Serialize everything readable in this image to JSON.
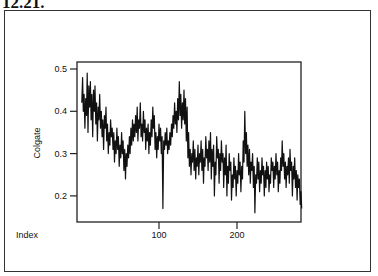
{
  "heading": "12.21.",
  "chart_data": {
    "type": "line",
    "title": "",
    "xlabel": "Index",
    "ylabel": "Colgate",
    "xlim": [
      0,
      280
    ],
    "ylim": [
      0.14,
      0.52
    ],
    "xticks": [
      100,
      200
    ],
    "yticks": [
      0.2,
      0.3,
      0.4,
      0.5
    ],
    "grid": false,
    "legend": null,
    "x_start": 1,
    "values": [
      0.42,
      0.48,
      0.4,
      0.44,
      0.36,
      0.43,
      0.39,
      0.49,
      0.35,
      0.46,
      0.41,
      0.47,
      0.38,
      0.44,
      0.34,
      0.45,
      0.4,
      0.46,
      0.37,
      0.42,
      0.33,
      0.41,
      0.38,
      0.44,
      0.36,
      0.4,
      0.34,
      0.38,
      0.31,
      0.39,
      0.36,
      0.41,
      0.33,
      0.37,
      0.3,
      0.35,
      0.32,
      0.38,
      0.34,
      0.36,
      0.31,
      0.35,
      0.28,
      0.33,
      0.3,
      0.36,
      0.31,
      0.34,
      0.27,
      0.32,
      0.29,
      0.35,
      0.3,
      0.33,
      0.26,
      0.31,
      0.24,
      0.3,
      0.27,
      0.32,
      0.29,
      0.34,
      0.3,
      0.36,
      0.32,
      0.38,
      0.33,
      0.37,
      0.34,
      0.39,
      0.35,
      0.41,
      0.33,
      0.38,
      0.36,
      0.42,
      0.34,
      0.37,
      0.33,
      0.4,
      0.35,
      0.38,
      0.31,
      0.36,
      0.33,
      0.37,
      0.3,
      0.35,
      0.32,
      0.38,
      0.34,
      0.41,
      0.36,
      0.39,
      0.31,
      0.35,
      0.29,
      0.34,
      0.31,
      0.37,
      0.33,
      0.36,
      0.3,
      0.34,
      0.17,
      0.33,
      0.31,
      0.35,
      0.32,
      0.36,
      0.3,
      0.33,
      0.31,
      0.35,
      0.32,
      0.37,
      0.34,
      0.39,
      0.36,
      0.42,
      0.37,
      0.4,
      0.35,
      0.43,
      0.38,
      0.47,
      0.39,
      0.44,
      0.36,
      0.42,
      0.38,
      0.45,
      0.37,
      0.43,
      0.33,
      0.41,
      0.29,
      0.35,
      0.27,
      0.31,
      0.25,
      0.3,
      0.28,
      0.33,
      0.26,
      0.31,
      0.24,
      0.29,
      0.27,
      0.32,
      0.25,
      0.3,
      0.28,
      0.33,
      0.26,
      0.31,
      0.23,
      0.29,
      0.27,
      0.34,
      0.29,
      0.31,
      0.26,
      0.33,
      0.28,
      0.35,
      0.24,
      0.31,
      0.27,
      0.32,
      0.2,
      0.28,
      0.25,
      0.34,
      0.29,
      0.31,
      0.23,
      0.3,
      0.26,
      0.33,
      0.28,
      0.3,
      0.22,
      0.29,
      0.25,
      0.32,
      0.2,
      0.27,
      0.23,
      0.3,
      0.26,
      0.28,
      0.19,
      0.25,
      0.22,
      0.29,
      0.24,
      0.27,
      0.2,
      0.26,
      0.23,
      0.3,
      0.25,
      0.28,
      0.21,
      0.27,
      0.24,
      0.33,
      0.28,
      0.4,
      0.3,
      0.35,
      0.27,
      0.32,
      0.25,
      0.31,
      0.23,
      0.28,
      0.26,
      0.3,
      0.22,
      0.27,
      0.16,
      0.25,
      0.23,
      0.29,
      0.24,
      0.28,
      0.21,
      0.26,
      0.23,
      0.29,
      0.25,
      0.27,
      0.2,
      0.26,
      0.22,
      0.28,
      0.24,
      0.27,
      0.21,
      0.25,
      0.23,
      0.29,
      0.26,
      0.28,
      0.22,
      0.27,
      0.24,
      0.3,
      0.25,
      0.28,
      0.21,
      0.26,
      0.23,
      0.29,
      0.26,
      0.33,
      0.27,
      0.3,
      0.24,
      0.28,
      0.22,
      0.27,
      0.25,
      0.29,
      0.23,
      0.31,
      0.26,
      0.28,
      0.2,
      0.27,
      0.24,
      0.29,
      0.22,
      0.26,
      0.19,
      0.25,
      0.22,
      0.24,
      0.18,
      0.21,
      0.17
    ]
  }
}
